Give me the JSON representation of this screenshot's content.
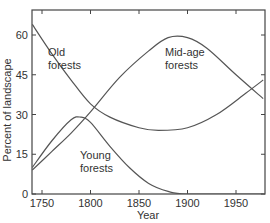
{
  "chart_data": {
    "type": "line",
    "title": "",
    "xlabel": "Year",
    "ylabel": "Percent of landscape",
    "xlim": [
      1740,
      1980
    ],
    "ylim": [
      0,
      70
    ],
    "xticks": [
      1750,
      1800,
      1850,
      1900,
      1950
    ],
    "yticks": [
      0,
      15,
      30,
      45,
      60
    ],
    "grid": false,
    "legend": "inline labels",
    "series": [
      {
        "name": "Old forests",
        "label_lines": [
          "Old",
          "forests"
        ],
        "x": [
          1740,
          1760,
          1780,
          1800,
          1820,
          1850,
          1870,
          1900,
          1930,
          1960,
          1978
        ],
        "values": [
          64,
          53,
          43,
          34,
          29,
          25,
          24,
          25,
          30,
          38,
          43
        ]
      },
      {
        "name": "Mid-age forests",
        "label_lines": [
          "Mid-age",
          "forests"
        ],
        "x": [
          1740,
          1760,
          1780,
          1800,
          1830,
          1860,
          1880,
          1900,
          1920,
          1950,
          1978
        ],
        "values": [
          9,
          16,
          23,
          31,
          44,
          54,
          59,
          59,
          55,
          45,
          36
        ]
      },
      {
        "name": "Young forests",
        "label_lines": [
          "Young",
          "forests"
        ],
        "x": [
          1740,
          1760,
          1780,
          1790,
          1800,
          1820,
          1840,
          1860,
          1880,
          1900,
          1978
        ],
        "values": [
          10,
          20,
          28,
          29,
          27,
          18,
          10,
          4,
          1,
          0,
          0
        ]
      }
    ],
    "line_color": "#555555"
  }
}
